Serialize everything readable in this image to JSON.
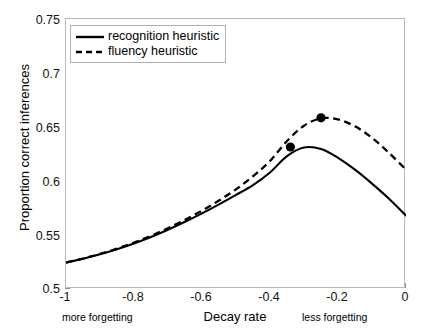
{
  "chart_data": {
    "type": "line",
    "title": "",
    "xlabel": "Decay rate",
    "ylabel": "Proportion correct inferences",
    "xlim": [
      -1,
      0
    ],
    "ylim": [
      0.5,
      0.75
    ],
    "xticks": [
      "-1",
      "-0.8",
      "-0.6",
      "-0.4",
      "-0.2",
      "0"
    ],
    "xtick_values": [
      -1,
      -0.8,
      -0.6,
      -0.4,
      -0.2,
      0
    ],
    "yticks": [
      "0.5",
      "0.55",
      "0.6",
      "0.65",
      "0.7",
      "0.75"
    ],
    "ytick_values": [
      0.5,
      0.55,
      0.6,
      0.65,
      0.7,
      0.75
    ],
    "grid": false,
    "legend_position": "upper left",
    "annotations": [
      {
        "text": "more forgetting",
        "x": -1,
        "position": "below-axis-left"
      },
      {
        "text": "less forgetting",
        "x": -0.2,
        "position": "below-axis-right"
      }
    ],
    "series": [
      {
        "name": "recognition heuristic",
        "style": "solid",
        "color": "#000000",
        "x": [
          -1.0,
          -0.95,
          -0.9,
          -0.85,
          -0.8,
          -0.75,
          -0.7,
          -0.65,
          -0.6,
          -0.55,
          -0.5,
          -0.45,
          -0.4,
          -0.35,
          -0.3,
          -0.25,
          -0.2,
          -0.15,
          -0.1,
          -0.05,
          0.0
        ],
        "y": [
          0.5245,
          0.5281,
          0.5322,
          0.5369,
          0.5422,
          0.5482,
          0.5549,
          0.5622,
          0.57,
          0.5783,
          0.5871,
          0.5962,
          0.6079,
          0.623,
          0.631,
          0.6296,
          0.6215,
          0.6105,
          0.5976,
          0.5836,
          0.568
        ],
        "markers": [
          {
            "x": -0.34,
            "y": 0.6315,
            "label": "peak"
          }
        ]
      },
      {
        "name": "fluency heuristic",
        "style": "dashed",
        "color": "#000000",
        "x": [
          -1.0,
          -0.95,
          -0.9,
          -0.85,
          -0.8,
          -0.75,
          -0.7,
          -0.65,
          -0.6,
          -0.55,
          -0.5,
          -0.45,
          -0.4,
          -0.35,
          -0.3,
          -0.25,
          -0.2,
          -0.15,
          -0.1,
          -0.05,
          0.0
        ],
        "y": [
          0.5245,
          0.5282,
          0.5325,
          0.5374,
          0.543,
          0.5493,
          0.5563,
          0.5641,
          0.5726,
          0.5819,
          0.5923,
          0.6044,
          0.6185,
          0.637,
          0.6512,
          0.658,
          0.657,
          0.6506,
          0.64,
          0.626,
          0.6105
        ],
        "markers": [
          {
            "x": -0.25,
            "y": 0.6585,
            "label": "peak"
          }
        ]
      }
    ]
  },
  "legend": {
    "items": [
      {
        "label": "recognition heuristic",
        "style": "solid"
      },
      {
        "label": "fluency heuristic",
        "style": "dashed"
      }
    ]
  }
}
